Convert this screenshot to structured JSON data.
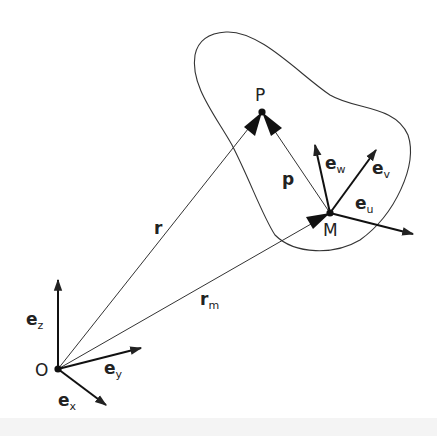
{
  "diagram": {
    "points": {
      "O": {
        "label": "O",
        "x": 58,
        "y": 369
      },
      "P": {
        "label": "P",
        "x": 262,
        "y": 112
      },
      "M": {
        "label": "M",
        "x": 330,
        "y": 213
      }
    },
    "vectors": [
      {
        "name": "r",
        "label": "r",
        "sub": "",
        "from": "O",
        "to": "P"
      },
      {
        "name": "r_m",
        "label": "r",
        "sub": "m",
        "from": "O",
        "to": "M"
      },
      {
        "name": "p",
        "label": "p",
        "sub": "",
        "from": "M",
        "to": "P"
      }
    ],
    "global_frame": [
      {
        "label": "e",
        "sub": "z"
      },
      {
        "label": "e",
        "sub": "y"
      },
      {
        "label": "e",
        "sub": "x"
      }
    ],
    "body_frame": [
      {
        "label": "e",
        "sub": "w"
      },
      {
        "label": "e",
        "sub": "v"
      },
      {
        "label": "e",
        "sub": "u"
      }
    ],
    "colors": {
      "stroke": "#222222",
      "background": "#ffffff"
    }
  }
}
